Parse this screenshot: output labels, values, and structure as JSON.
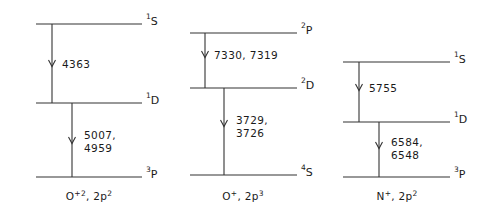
{
  "figure": {
    "kind": "energy-level-diagram",
    "background_color": "#ffffff",
    "line_color": "#333333",
    "text_color": "#1a1a1a"
  },
  "chart_data": {
    "type": "diagram",
    "title": "",
    "xlabel": "",
    "ylabel": "",
    "panels": [
      {
        "caption_species": "O",
        "caption_charge": "+2",
        "caption_config_base": ", 2p",
        "caption_config_sup": "2",
        "caption_full": "O+2, 2p2",
        "levels": [
          {
            "name": "1S",
            "pre": "1",
            "letter": "S",
            "y": 24
          },
          {
            "name": "1D",
            "pre": "1",
            "letter": "D",
            "y": 103
          },
          {
            "name": "3P",
            "pre": "3",
            "letter": "P",
            "y": 177
          }
        ],
        "transitions": [
          {
            "from": "1S",
            "to": "1D",
            "labels": [
              "4363"
            ]
          },
          {
            "from": "1D",
            "to": "3P",
            "labels": [
              "5007,",
              "4959"
            ]
          }
        ]
      },
      {
        "caption_species": "O",
        "caption_charge": "+",
        "caption_config_base": ", 2p",
        "caption_config_sup": "3",
        "caption_full": "O+, 2p3",
        "levels": [
          {
            "name": "2P",
            "pre": "2",
            "letter": "P",
            "y": 33
          },
          {
            "name": "2D",
            "pre": "2",
            "letter": "D",
            "y": 88
          },
          {
            "name": "4S",
            "pre": "4",
            "letter": "S",
            "y": 175
          }
        ],
        "transitions": [
          {
            "from": "2P",
            "to": "2D",
            "labels": [
              "7330, 7319"
            ]
          },
          {
            "from": "2D",
            "to": "4S",
            "labels": [
              "3729,",
              "3726"
            ]
          }
        ]
      },
      {
        "caption_species": "N",
        "caption_charge": "+",
        "caption_config_base": ", 2p",
        "caption_config_sup": "2",
        "caption_full": "N+, 2p2",
        "levels": [
          {
            "name": "1S",
            "pre": "1",
            "letter": "S",
            "y": 62
          },
          {
            "name": "1D",
            "pre": "1",
            "letter": "D",
            "y": 122
          },
          {
            "name": "3P",
            "pre": "3",
            "letter": "P",
            "y": 177
          }
        ],
        "transitions": [
          {
            "from": "1S",
            "to": "1D",
            "labels": [
              "5755"
            ]
          },
          {
            "from": "1D",
            "to": "3P",
            "labels": [
              "6584,",
              "6548"
            ]
          }
        ]
      }
    ]
  }
}
